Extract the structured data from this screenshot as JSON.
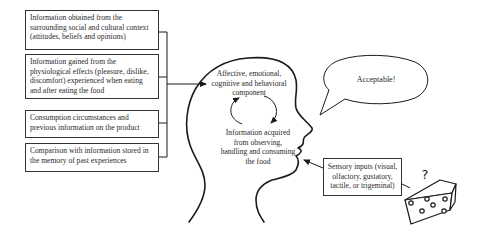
{
  "diagram": {
    "type": "conceptual-flow",
    "input_boxes": [
      {
        "id": "social",
        "text": "Information obtained from the surrounding social and cultural context (attitudes, beliefs and opinions)"
      },
      {
        "id": "physiological",
        "text": "Information gained from the physiological effects (pleasure, dislike, discomfort) experienced when eating and after eating the food"
      },
      {
        "id": "circumstances",
        "text": "Consumption circumstances and previous information on the product"
      },
      {
        "id": "memory",
        "text": "Comparison with information stored in the memory of past experiences"
      }
    ],
    "head": {
      "upper_label": "Affective, emotional, cognitive and behavioral component",
      "lower_label": "Information acquired from observing, handling and consuming the food"
    },
    "speech_bubble": {
      "text": "Acceptable!"
    },
    "sensory_box": {
      "text": "Sensory inputs (visual, olfactory, gustatory, tactile, or trigeminal)"
    },
    "food": {
      "icon": "cheese-icon",
      "question_mark": "?"
    },
    "colors": {
      "line": "#1a1a1a",
      "box_border": "#333333",
      "text": "#2a2a2a",
      "background": "#ffffff"
    }
  }
}
